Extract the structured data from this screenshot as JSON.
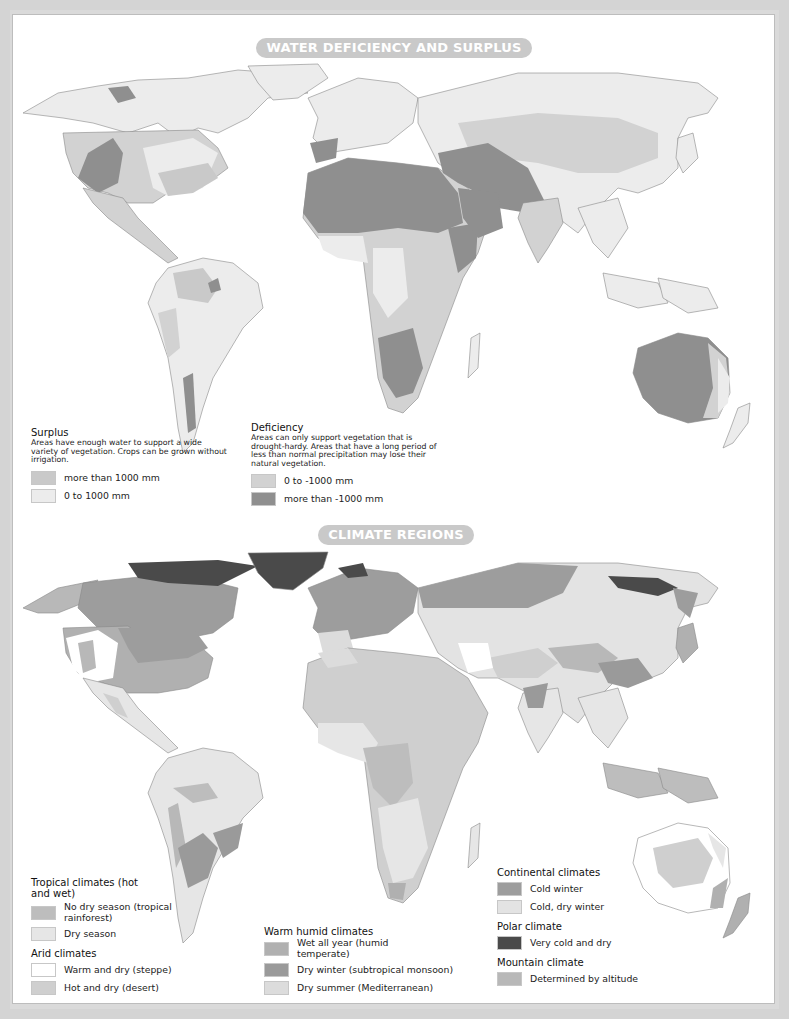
{
  "colors": {
    "page_frame": "#d4d4d4",
    "sheet": "#ffffff",
    "title_pill": "#c9c9c9",
    "ocean": "#ffffff",
    "border_line": "#555555"
  },
  "water_map": {
    "title": "WATER DEFICIENCY AND SURPLUS",
    "legend": {
      "surplus": {
        "heading": "Surplus",
        "description": "Areas have enough water to support a wide variety of vegetation. Crops can be grown without irrigation.",
        "items": [
          {
            "label": "more than 1000 mm",
            "color": "#c9c9c9"
          },
          {
            "label": "0 to 1000 mm",
            "color": "#ececec"
          }
        ]
      },
      "deficiency": {
        "heading": "Deficiency",
        "description": "Areas can only support vegetation that is drought-hardy.  Areas that have a long period of less than normal precipitation may lose their natural vegetation.",
        "items": [
          {
            "label": "0 to -1000 mm",
            "color": "#d2d2d2"
          },
          {
            "label": "more than -1000 mm",
            "color": "#8f8f8f"
          }
        ]
      }
    }
  },
  "climate_map": {
    "title": "CLIMATE REGIONS",
    "legend": {
      "tropical": {
        "heading": "Tropical climates (hot and wet)",
        "items": [
          {
            "label": "No dry season (tropical rainforest)",
            "color": "#bdbdbd"
          },
          {
            "label": "Dry season",
            "color": "#e6e6e6"
          }
        ]
      },
      "arid": {
        "heading": "Arid climates",
        "items": [
          {
            "label": "Warm and dry (steppe)",
            "color": "#ffffff"
          },
          {
            "label": "Hot and dry (desert)",
            "color": "#cfcfcf"
          }
        ]
      },
      "warm_humid": {
        "heading": "Warm humid climates",
        "items": [
          {
            "label": "Wet all year (humid temperate)",
            "color": "#b0b0b0"
          },
          {
            "label": "Dry winter (subtropical monsoon)",
            "color": "#9a9a9a"
          },
          {
            "label": "Dry summer (Mediterranean)",
            "color": "#dcdcdc"
          }
        ]
      },
      "continental": {
        "heading": "Continental climates",
        "items": [
          {
            "label": "Cold winter",
            "color": "#9d9d9d"
          },
          {
            "label": "Cold, dry winter",
            "color": "#e3e3e3"
          }
        ]
      },
      "polar": {
        "heading": "Polar climate",
        "items": [
          {
            "label": "Very cold and dry",
            "color": "#4a4a4a"
          }
        ]
      },
      "mountain": {
        "heading": "Mountain climate",
        "items": [
          {
            "label": "Determined by altitude",
            "color": "#b8b8b8"
          }
        ]
      }
    }
  }
}
